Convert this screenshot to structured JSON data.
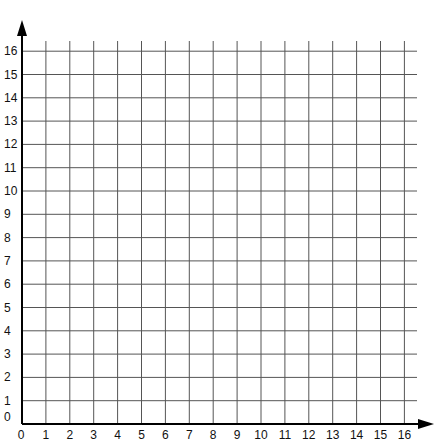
{
  "chart_data": {
    "type": "grid",
    "title": "",
    "xlabel": "",
    "ylabel": "",
    "xlim": [
      0,
      16
    ],
    "ylim": [
      0,
      16
    ],
    "x_ticks": [
      "0",
      "1",
      "2",
      "3",
      "4",
      "5",
      "6",
      "7",
      "8",
      "9",
      "10",
      "11",
      "12",
      "13",
      "14",
      "15",
      "16"
    ],
    "y_ticks": [
      "0",
      "1",
      "2",
      "3",
      "4",
      "5",
      "6",
      "7",
      "8",
      "9",
      "10",
      "11",
      "12",
      "13",
      "14",
      "15",
      "16"
    ],
    "grid": true,
    "series": []
  },
  "colors": {
    "grid": "#555555",
    "axis": "#000000",
    "text": "#111111"
  }
}
